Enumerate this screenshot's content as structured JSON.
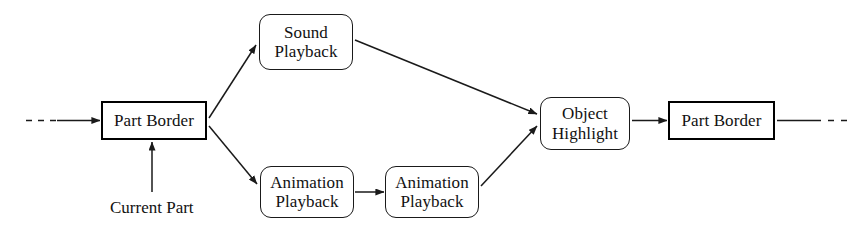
{
  "diagram": {
    "background_color": "#ffffff",
    "stroke_color": "#1a1a1a",
    "nodes": [
      {
        "id": "part-border-left",
        "label": "Part Border",
        "lines": [
          "Part Border"
        ],
        "shape": "rectangle",
        "border": "thick",
        "x": 101,
        "y": 101,
        "w": 106,
        "h": 39
      },
      {
        "id": "sound-playback",
        "label": "Sound Playback",
        "lines": [
          "Sound",
          "Playback"
        ],
        "shape": "rounded-rectangle",
        "border": "thin",
        "x": 259,
        "y": 14,
        "w": 94,
        "h": 56
      },
      {
        "id": "animation-playback-1",
        "label": "Animation Playback",
        "lines": [
          "Animation",
          "Playback"
        ],
        "shape": "rounded-rectangle",
        "border": "thin",
        "x": 260,
        "y": 166,
        "w": 94,
        "h": 52
      },
      {
        "id": "animation-playback-2",
        "label": "Animation Playback",
        "lines": [
          "Animation",
          "Playback"
        ],
        "shape": "rounded-rectangle",
        "border": "thin",
        "x": 385,
        "y": 166,
        "w": 94,
        "h": 52
      },
      {
        "id": "object-highlight",
        "label": "Object Highlight",
        "lines": [
          "Object",
          "Highlight"
        ],
        "shape": "rounded-rectangle",
        "border": "thin",
        "x": 540,
        "y": 97,
        "w": 90,
        "h": 53
      },
      {
        "id": "part-border-right",
        "label": "Part Border",
        "lines": [
          "Part Border"
        ],
        "shape": "rectangle",
        "border": "thick",
        "x": 668,
        "y": 101,
        "w": 107,
        "h": 39
      }
    ],
    "labels": [
      {
        "id": "current-part",
        "text": "Current Part",
        "x": 110,
        "y": 198
      }
    ],
    "edges": [
      {
        "id": "entry-dashed",
        "from": "(outside-left)",
        "to": "part-border-left",
        "style": "dashed-then-solid",
        "arrow": true
      },
      {
        "id": "current-part-to-part-border",
        "from": "current-part",
        "to": "part-border-left",
        "style": "solid",
        "arrow": true
      },
      {
        "id": "part-border-to-sound",
        "from": "part-border-left",
        "to": "sound-playback",
        "style": "solid",
        "arrow": true
      },
      {
        "id": "part-border-to-animation1",
        "from": "part-border-left",
        "to": "animation-playback-1",
        "style": "solid",
        "arrow": true
      },
      {
        "id": "animation1-to-animation2",
        "from": "animation-playback-1",
        "to": "animation-playback-2",
        "style": "solid",
        "arrow": true
      },
      {
        "id": "sound-to-object-highlight",
        "from": "sound-playback",
        "to": "object-highlight",
        "style": "solid",
        "arrow": true
      },
      {
        "id": "animation2-to-object-highlight",
        "from": "animation-playback-2",
        "to": "object-highlight",
        "style": "solid",
        "arrow": true
      },
      {
        "id": "object-highlight-to-part-border-right",
        "from": "object-highlight",
        "to": "part-border-right",
        "style": "solid",
        "arrow": true
      },
      {
        "id": "exit-dashed",
        "from": "part-border-right",
        "to": "(outside-right)",
        "style": "solid-then-dashed",
        "arrow": false
      }
    ]
  }
}
